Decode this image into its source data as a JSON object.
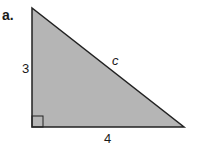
{
  "figure": {
    "part_label": "a.",
    "sides": {
      "vertical": "3",
      "horizontal": "4",
      "hypotenuse": "c"
    },
    "colors": {
      "fill": "#b5b5b5",
      "stroke": "#222222"
    }
  }
}
